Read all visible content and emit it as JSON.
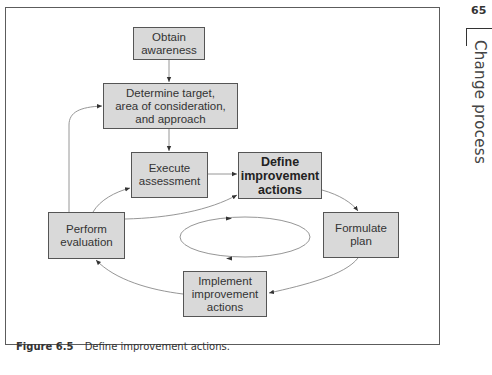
{
  "page": {
    "number": "65",
    "chapter_title": "Change process"
  },
  "figure": {
    "label": "Figure 6.5",
    "caption": "Define improvement actions."
  },
  "diagram": {
    "nodes": {
      "obtain_awareness": {
        "line1": "Obtain",
        "line2": "awareness"
      },
      "determine_target": {
        "line1": "Determine target,",
        "line2": "area of consideration,",
        "line3": "and approach"
      },
      "execute_assessment": {
        "line1": "Execute",
        "line2": "assessment"
      },
      "define_improvement_actions": {
        "line1": "Define",
        "line2": "improvement",
        "line3": "actions",
        "highlighted": true
      },
      "perform_evaluation": {
        "line1": "Perform",
        "line2": "evaluation"
      },
      "formulate_plan": {
        "line1": "Formulate",
        "line2": "plan"
      },
      "implement_improvement_actions": {
        "line1": "Implement",
        "line2": "improvement",
        "line3": "actions"
      }
    },
    "edges": [
      {
        "from": "obtain_awareness",
        "to": "determine_target"
      },
      {
        "from": "determine_target",
        "to": "execute_assessment"
      },
      {
        "from": "execute_assessment",
        "to": "define_improvement_actions"
      },
      {
        "from": "define_improvement_actions",
        "to": "formulate_plan"
      },
      {
        "from": "formulate_plan",
        "to": "implement_improvement_actions"
      },
      {
        "from": "implement_improvement_actions",
        "to": "perform_evaluation"
      },
      {
        "from": "perform_evaluation",
        "to": "execute_assessment"
      },
      {
        "from": "perform_evaluation",
        "to": "define_improvement_actions"
      },
      {
        "from": "perform_evaluation",
        "to": "determine_target"
      }
    ],
    "center_cycle": "clockwise-ellipse",
    "colors": {
      "box_fill": "#d9d9d9",
      "box_border": "#555555",
      "line": "#777777"
    }
  }
}
